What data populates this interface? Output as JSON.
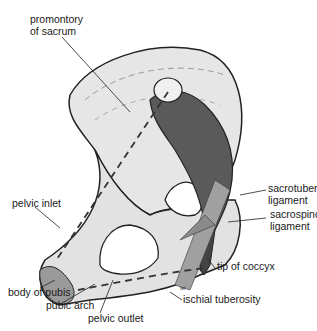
{
  "figure": {
    "labels": {
      "promontory_line1": "promontory",
      "promontory_line2": "of sacrum",
      "sacrotuberous_line1": "sacrotuberous",
      "sacrotuberous_line2": "ligament",
      "sacrospinous_line1": "sacrospinous",
      "sacrospinous_line2": "ligament",
      "pelvic_inlet": "pelvic inlet",
      "tip_of_coccyx": "tip of coccyx",
      "body_of_pubis": "body of pubis",
      "pubic_arch": "pubic arch",
      "pelvic_outlet": "pelvic outlet",
      "ischial_tuberosity": "ischial tuberosity",
      "artist_mark": "tel"
    },
    "colors": {
      "bone": "#e6e6e6",
      "bone_shadow": "#c8c8c8",
      "outline": "#222222",
      "sacrum": "#5a5a5a",
      "ligament": "#8a8a8a"
    }
  }
}
